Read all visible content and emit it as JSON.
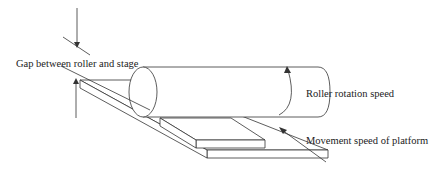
{
  "diagram": {
    "labels": {
      "gap": "Gap between roller and stage",
      "rotation": "Roller rotation speed",
      "movement": "Movement speed of platform"
    },
    "components": [
      "roller",
      "stage",
      "platform"
    ],
    "colors": {
      "line": "#333333",
      "background": "#ffffff",
      "text": "#222222"
    }
  }
}
